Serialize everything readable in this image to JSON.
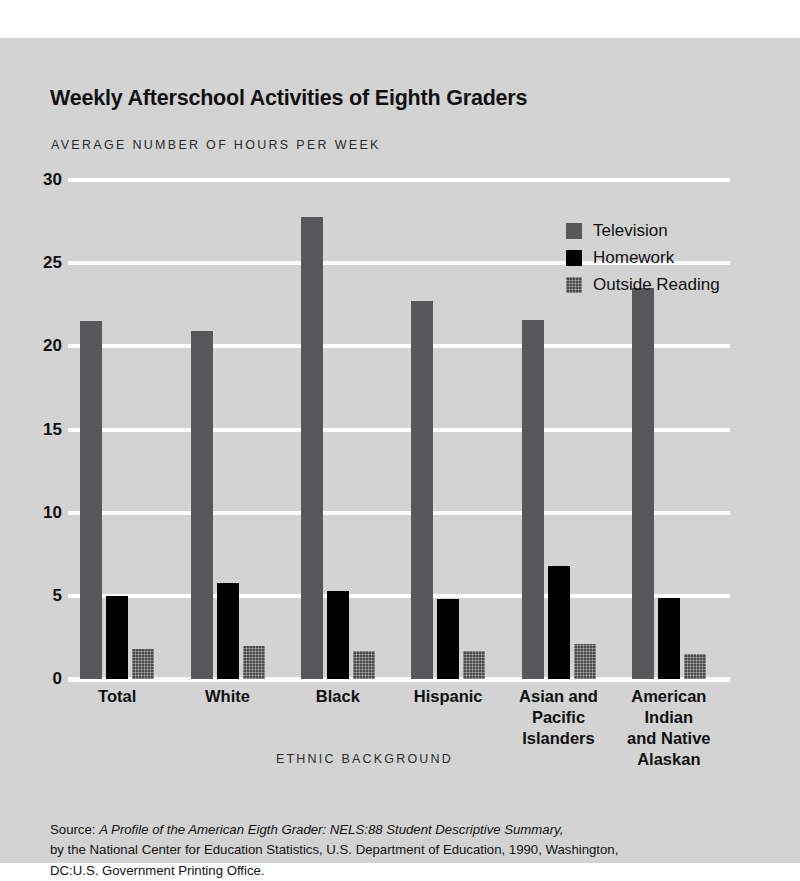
{
  "page": {
    "scan_fragment_left": "",
    "scan_fragment_right": ""
  },
  "figure": {
    "title": "Weekly Afterschool Activities of Eighth Graders",
    "y_axis_title": "AVERAGE NUMBER OF HOURS PER WEEK",
    "x_axis_title": "ETHNIC BACKGROUND",
    "background_color": "#d3d3d3",
    "gridline_color": "#ffffff"
  },
  "source_note": {
    "prefix": "Source: ",
    "italic_title": "A Profile of the American Eigth Grader: NELS:88 Student Descriptive Summary,",
    "line2": "by the National Center for Education Statistics, U.S. Department of Education, 1990, Washington,",
    "line3": "DC:U.S. Government Printing Office."
  },
  "chart_data": {
    "type": "bar",
    "title": "Weekly Afterschool Activities of Eighth Graders",
    "subtitle": "",
    "xlabel": "ETHNIC BACKGROUND",
    "ylabel": "AVERAGE NUMBER OF HOURS PER WEEK",
    "ylim": [
      0,
      30
    ],
    "yticks": [
      0,
      5,
      10,
      15,
      20,
      25,
      30
    ],
    "ytick_labels": [
      "0",
      "5",
      "10",
      "15",
      "20",
      "25",
      "30"
    ],
    "grid": true,
    "grid_axis": "y",
    "legend_position": "upper right",
    "categories": [
      "Total",
      "White",
      "Black",
      "Hispanic",
      "Asian and Pacific Islanders",
      "American Indian and Native Alaskan"
    ],
    "category_label_lines": [
      [
        "Total"
      ],
      [
        "White"
      ],
      [
        "Black"
      ],
      [
        "Hispanic"
      ],
      [
        "Asian and",
        "Pacific",
        "Islanders"
      ],
      [
        "American",
        "Indian",
        "and Native",
        "Alaskan"
      ]
    ],
    "series": [
      {
        "name": "Television",
        "color": "#58585a",
        "values": [
          21.5,
          20.9,
          27.8,
          22.7,
          21.6,
          23.5
        ]
      },
      {
        "name": "Homework",
        "color": "#000000",
        "values": [
          5.0,
          5.8,
          5.3,
          4.8,
          6.8,
          4.9
        ]
      },
      {
        "name": "Outside Reading",
        "color": "#4a4a4c",
        "values": [
          1.8,
          2.0,
          1.7,
          1.7,
          2.1,
          1.5
        ]
      }
    ]
  }
}
